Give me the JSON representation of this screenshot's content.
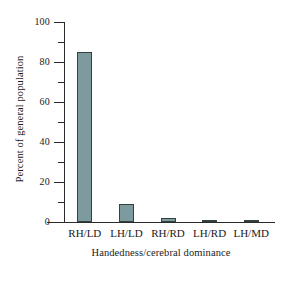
{
  "chart_data": {
    "type": "bar",
    "title": "",
    "xlabel": "Handedness/cerebral dominance",
    "ylabel": "Percent of general population",
    "categories": [
      "RH/LD",
      "LH/LD",
      "RH/RD",
      "LH/RD",
      "LH/MD"
    ],
    "values": [
      85,
      9,
      2,
      1,
      1
    ],
    "ylim": [
      0,
      100
    ],
    "ytick_labels": [
      "0",
      "20",
      "40",
      "60",
      "80",
      "100"
    ],
    "ytick_values": [
      0,
      20,
      40,
      60,
      80,
      100
    ],
    "yminor_tick_values": [
      10,
      30,
      50,
      70,
      90
    ],
    "grid": false,
    "legend": null,
    "bar_color": "#7d9a9e",
    "bar_edge_color": "#33413f",
    "axis_color": "#2b2b2b",
    "background": "#ffffff"
  }
}
